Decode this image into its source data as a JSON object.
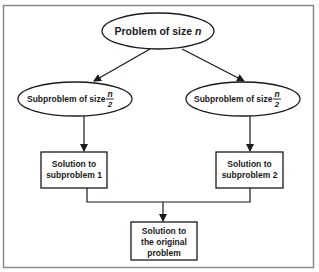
{
  "diagram": {
    "root": {
      "label": "Problem of size ",
      "var": "n"
    },
    "subproblems": [
      {
        "label": "Subproblem of size ",
        "frac_num": "n",
        "frac_den": "2"
      },
      {
        "label": "Subproblem of size ",
        "frac_num": "n",
        "frac_den": "2"
      }
    ],
    "solutions": [
      {
        "line1": "Solution to",
        "line2": "subproblem 1"
      },
      {
        "line1": "Solution to",
        "line2": "subproblem 2"
      }
    ],
    "final": {
      "line1": "Solution to",
      "line2": "the original",
      "line3": "problem"
    },
    "colors": {
      "stroke": "#1a1a1a",
      "frame": "#8a8a8a",
      "background": "#ffffff"
    }
  }
}
